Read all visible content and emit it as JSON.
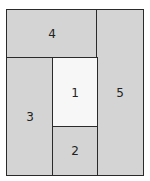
{
  "diagram": {
    "regions": [
      {
        "id": "1",
        "label": "1",
        "fill": "#f7f7f7"
      },
      {
        "id": "2",
        "label": "2",
        "fill": "#d4d4d4"
      },
      {
        "id": "3",
        "label": "3",
        "fill": "#d4d4d4"
      },
      {
        "id": "4",
        "label": "4",
        "fill": "#d4d4d4"
      },
      {
        "id": "5",
        "label": "5",
        "fill": "#d4d4d4"
      }
    ],
    "border_color": "#2a2a2a"
  }
}
